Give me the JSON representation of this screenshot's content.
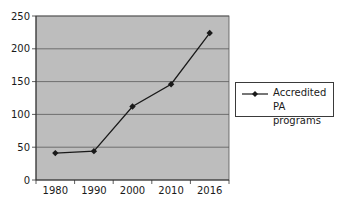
{
  "chart_data": {
    "type": "line",
    "title": "",
    "xlabel": "",
    "ylabel": "",
    "categories": [
      "1980",
      "1990",
      "2000",
      "2010",
      "2016"
    ],
    "series": [
      {
        "name": "Accredited PA programs",
        "values": [
          41,
          44,
          112,
          146,
          224
        ],
        "color": "#1a1a1a",
        "marker": "diamond"
      }
    ],
    "ylim": [
      0,
      250
    ],
    "yticks": [
      0,
      50,
      100,
      150,
      200,
      250
    ],
    "grid": true,
    "legend_position": "right",
    "plot_background": "#bdbdbd"
  },
  "legend": {
    "label": "Accredited PA programs"
  }
}
